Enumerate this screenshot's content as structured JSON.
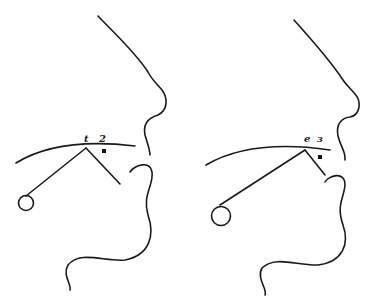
{
  "figure": {
    "panels": [
      {
        "id": "left",
        "labels": [
          "t",
          "2"
        ],
        "has_marker": true
      },
      {
        "id": "right",
        "labels": [
          "e",
          "ɜ"
        ],
        "has_marker": true
      }
    ],
    "colors": {
      "ink": "#1a1a1a",
      "background": "#ffffff"
    }
  }
}
